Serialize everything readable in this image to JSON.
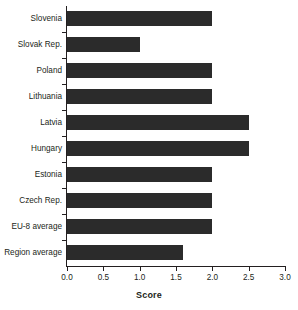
{
  "chart_data": {
    "type": "bar",
    "orientation": "horizontal",
    "title": "",
    "subtitle": "",
    "xlabel": "Score",
    "ylabel": "",
    "categories": [
      "Slovenia",
      "Slovak Rep.",
      "Poland",
      "Lithuania",
      "Latvia",
      "Hungary",
      "Estonia",
      "Czech Rep.",
      "EU-8 average",
      "Region average"
    ],
    "values": [
      2.0,
      1.0,
      2.0,
      2.0,
      2.5,
      2.5,
      2.0,
      2.0,
      2.0,
      1.6
    ],
    "xlim": [
      0.0,
      3.0
    ],
    "xticks": [
      0.0,
      0.5,
      1.0,
      1.5,
      2.0,
      2.5,
      3.0
    ],
    "xtick_labels": [
      "0.0",
      "0.5",
      "1.0",
      "1.5",
      "2.0",
      "2.5",
      "3.0"
    ],
    "grid": false,
    "legend": null,
    "bar_color": "#2b2b2b",
    "axis_color": "#231f20",
    "background_color": "#ffffff"
  }
}
